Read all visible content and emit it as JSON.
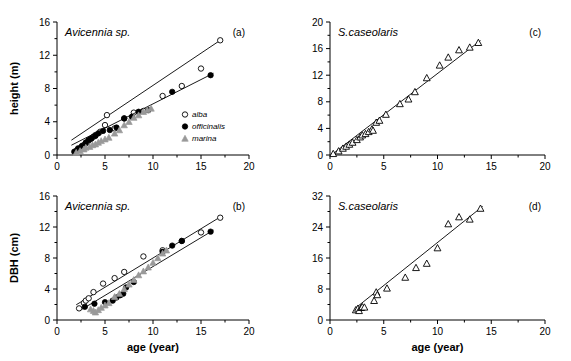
{
  "figure": {
    "panels": [
      "a",
      "b",
      "c",
      "d"
    ],
    "axis_title_x": "age (year)",
    "axis_title_y_height": "height (m)",
    "axis_title_y_dbh": "DBH (cm)"
  },
  "legend": {
    "position": "bottom-right of panel a",
    "items": [
      {
        "label": "alba",
        "marker": "open-circle",
        "color": "#000000"
      },
      {
        "label": "officinalis",
        "marker": "filled-circle",
        "color": "#000000"
      },
      {
        "label": "marina",
        "marker": "gray-triangle",
        "color": "#999999"
      }
    ]
  },
  "chart_data": [
    {
      "type": "scatter",
      "panel": "a",
      "title": "Avicennia sp.",
      "panel_label": "(a)",
      "xlabel": "age (year)",
      "ylabel": "height (m)",
      "xlim": [
        0,
        20
      ],
      "ylim": [
        0,
        16
      ],
      "xticks": [
        0,
        5,
        10,
        15,
        20
      ],
      "yticks": [
        0,
        4,
        8,
        12,
        16
      ],
      "grid": false,
      "series": [
        {
          "name": "alba",
          "marker": "open-circle",
          "color": "#000000",
          "points": [
            [
              2.0,
              0.5
            ],
            [
              2.2,
              0.7
            ],
            [
              2.5,
              0.9
            ],
            [
              2.8,
              1.2
            ],
            [
              3.0,
              1.4
            ],
            [
              3.2,
              1.6
            ],
            [
              3.5,
              1.9
            ],
            [
              3.8,
              2.2
            ],
            [
              4.0,
              2.4
            ],
            [
              4.5,
              2.8
            ],
            [
              5.0,
              3.6
            ],
            [
              5.2,
              4.8
            ],
            [
              6.0,
              3.2
            ],
            [
              7.0,
              4.4
            ],
            [
              8.0,
              5.1
            ],
            [
              9.0,
              5.3
            ],
            [
              11.0,
              7.1
            ],
            [
              13.0,
              8.3
            ],
            [
              15.0,
              10.4
            ],
            [
              17.0,
              13.8
            ]
          ],
          "fit": {
            "slope": 0.775,
            "intercept": 0.62,
            "x_from": 1.5,
            "x_to": 17.2
          }
        },
        {
          "name": "officinalis",
          "marker": "filled-circle",
          "color": "#000000",
          "points": [
            [
              1.8,
              0.4
            ],
            [
              2.2,
              0.8
            ],
            [
              2.6,
              1.1
            ],
            [
              3.0,
              1.5
            ],
            [
              3.3,
              1.8
            ],
            [
              3.6,
              2.0
            ],
            [
              4.0,
              2.3
            ],
            [
              4.3,
              2.6
            ],
            [
              4.8,
              2.9
            ],
            [
              5.5,
              3.0
            ],
            [
              6.2,
              3.3
            ],
            [
              7.0,
              4.4
            ],
            [
              7.8,
              4.6
            ],
            [
              8.5,
              5.2
            ],
            [
              9.5,
              5.4
            ],
            [
              12.0,
              7.6
            ],
            [
              16.0,
              9.6
            ]
          ],
          "fit": {
            "slope": 0.585,
            "intercept": 0.3,
            "x_from": 1.5,
            "x_to": 16.3
          }
        },
        {
          "name": "marina",
          "marker": "gray-triangle",
          "color": "#999999",
          "points": [
            [
              2.0,
              0.3
            ],
            [
              2.4,
              0.5
            ],
            [
              2.8,
              0.7
            ],
            [
              3.0,
              0.9
            ],
            [
              3.4,
              1.0
            ],
            [
              3.7,
              1.2
            ],
            [
              4.0,
              1.3
            ],
            [
              4.3,
              1.5
            ],
            [
              4.6,
              1.7
            ],
            [
              5.0,
              1.9
            ],
            [
              5.4,
              2.1
            ],
            [
              6.0,
              2.6
            ],
            [
              6.5,
              3.0
            ],
            [
              7.0,
              3.6
            ],
            [
              7.5,
              4.0
            ],
            [
              8.0,
              4.5
            ],
            [
              8.5,
              4.8
            ],
            [
              9.0,
              5.2
            ],
            [
              9.4,
              5.4
            ],
            [
              9.8,
              5.6
            ]
          ],
          "fit": null
        }
      ]
    },
    {
      "type": "scatter",
      "panel": "b",
      "title": "Avicennia sp.",
      "panel_label": "(b)",
      "xlabel": "age (year)",
      "ylabel": "DBH (cm)",
      "xlim": [
        0,
        20
      ],
      "ylim": [
        0,
        16
      ],
      "xticks": [
        0,
        5,
        10,
        15,
        20
      ],
      "yticks": [
        0,
        4,
        8,
        12,
        16
      ],
      "grid": false,
      "series": [
        {
          "name": "alba",
          "marker": "open-circle",
          "color": "#000000",
          "points": [
            [
              2.3,
              1.5
            ],
            [
              2.8,
              2.2
            ],
            [
              3.0,
              2.5
            ],
            [
              3.3,
              2.8
            ],
            [
              3.8,
              3.6
            ],
            [
              4.8,
              4.7
            ],
            [
              6.0,
              5.4
            ],
            [
              7.0,
              6.2
            ],
            [
              9.0,
              8.2
            ],
            [
              11.0,
              9.0
            ],
            [
              13.0,
              10.2
            ],
            [
              15.0,
              11.3
            ],
            [
              17.0,
              13.2
            ]
          ],
          "fit": {
            "slope": 0.755,
            "intercept": 0.45,
            "x_from": 2.0,
            "x_to": 17.2
          }
        },
        {
          "name": "officinalis",
          "marker": "filled-circle",
          "color": "#000000",
          "points": [
            [
              2.9,
              1.7
            ],
            [
              3.9,
              2.1
            ],
            [
              5.0,
              2.3
            ],
            [
              5.8,
              2.5
            ],
            [
              6.2,
              2.9
            ],
            [
              6.6,
              3.2
            ],
            [
              6.9,
              3.4
            ],
            [
              7.2,
              4.2
            ],
            [
              8.0,
              4.9
            ],
            [
              11.0,
              8.8
            ],
            [
              12.0,
              9.6
            ],
            [
              13.0,
              10.2
            ],
            [
              16.0,
              11.4
            ]
          ],
          "fit": {
            "slope": 0.745,
            "intercept": -0.55,
            "x_from": 2.6,
            "x_to": 16.3
          }
        },
        {
          "name": "marina",
          "marker": "gray-triangle",
          "color": "#999999",
          "points": [
            [
              3.5,
              1.4
            ],
            [
              3.8,
              1.2
            ],
            [
              4.0,
              1.0
            ],
            [
              4.3,
              1.3
            ],
            [
              4.6,
              1.6
            ],
            [
              5.0,
              1.9
            ],
            [
              5.4,
              2.2
            ],
            [
              6.0,
              3.0
            ],
            [
              6.5,
              3.4
            ],
            [
              7.0,
              4.0
            ],
            [
              7.5,
              4.6
            ],
            [
              8.0,
              5.2
            ],
            [
              8.5,
              5.8
            ],
            [
              9.0,
              6.3
            ],
            [
              9.5,
              6.8
            ],
            [
              10.0,
              7.4
            ],
            [
              10.5,
              8.0
            ],
            [
              11.0,
              8.6
            ],
            [
              11.4,
              9.0
            ]
          ],
          "fit": null
        }
      ]
    },
    {
      "type": "scatter",
      "panel": "c",
      "title": "S.caseolaris",
      "panel_label": "(c)",
      "xlabel": "age (year)",
      "ylabel": "height (m)",
      "xlim": [
        0,
        20
      ],
      "ylim": [
        0,
        20
      ],
      "xticks": [
        0,
        5,
        10,
        15,
        20
      ],
      "yticks": [
        0,
        4,
        8,
        12,
        16,
        20
      ],
      "grid": false,
      "series": [
        {
          "name": "S.caseolaris",
          "marker": "open-triangle",
          "color": "#000000",
          "points": [
            [
              0.3,
              0.2
            ],
            [
              0.8,
              0.6
            ],
            [
              1.2,
              1.0
            ],
            [
              1.5,
              1.3
            ],
            [
              1.8,
              1.6
            ],
            [
              2.1,
              1.9
            ],
            [
              2.5,
              2.3
            ],
            [
              2.8,
              2.7
            ],
            [
              3.0,
              3.0
            ],
            [
              3.3,
              3.2
            ],
            [
              3.6,
              3.5
            ],
            [
              3.9,
              3.9
            ],
            [
              4.0,
              3.7
            ],
            [
              4.3,
              4.9
            ],
            [
              4.6,
              5.2
            ],
            [
              5.2,
              6.1
            ],
            [
              6.5,
              7.7
            ],
            [
              7.3,
              8.4
            ],
            [
              7.9,
              9.5
            ],
            [
              9.0,
              11.6
            ],
            [
              10.2,
              13.5
            ],
            [
              11.0,
              14.7
            ],
            [
              12.0,
              15.8
            ],
            [
              13.0,
              16.2
            ],
            [
              13.8,
              16.9
            ]
          ],
          "fit": {
            "slope": 1.24,
            "intercept": -0.15,
            "x_from": 0.2,
            "x_to": 14.0
          }
        }
      ]
    },
    {
      "type": "scatter",
      "panel": "d",
      "title": "S.caseolaris",
      "panel_label": "(d)",
      "xlabel": "age (year)",
      "ylabel": "DBH (cm)",
      "xlim": [
        0,
        20
      ],
      "ylim": [
        0,
        32
      ],
      "xticks": [
        0,
        5,
        10,
        15,
        20
      ],
      "yticks": [
        0,
        8,
        16,
        24,
        32
      ],
      "grid": false,
      "series": [
        {
          "name": "S.caseolaris",
          "marker": "open-triangle",
          "color": "#000000",
          "points": [
            [
              2.4,
              2.6
            ],
            [
              2.6,
              3.0
            ],
            [
              2.7,
              2.4
            ],
            [
              2.9,
              3.2
            ],
            [
              3.0,
              3.4
            ],
            [
              3.2,
              3.3
            ],
            [
              4.1,
              5.0
            ],
            [
              4.3,
              7.2
            ],
            [
              4.4,
              6.5
            ],
            [
              5.3,
              8.2
            ],
            [
              7.0,
              11.0
            ],
            [
              8.0,
              13.5
            ],
            [
              9.0,
              14.6
            ],
            [
              10.0,
              18.6
            ],
            [
              11.0,
              24.8
            ],
            [
              12.0,
              26.6
            ],
            [
              13.0,
              26.0
            ],
            [
              14.0,
              28.8
            ]
          ],
          "fit": {
            "slope": 2.22,
            "intercept": -2.2,
            "x_from": 2.3,
            "x_to": 14.2
          }
        }
      ]
    }
  ]
}
